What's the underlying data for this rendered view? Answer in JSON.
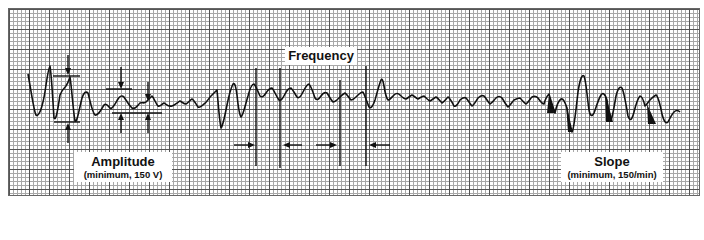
{
  "diagram": {
    "type": "fetal heart rate variability tracing (ECG-style grid paper)",
    "labels": {
      "frequency": {
        "title": "Frequency"
      },
      "amplitude": {
        "title": "Amplitude",
        "subtitle": "(minimum, 150 V)"
      },
      "slope": {
        "title": "Slope",
        "subtitle": "(minimum, 150/min)"
      }
    },
    "colors": {
      "trace": "#111111",
      "grid_major": "#555555",
      "grid_minor": "#a8a8a8",
      "background": "#ffffff"
    }
  }
}
